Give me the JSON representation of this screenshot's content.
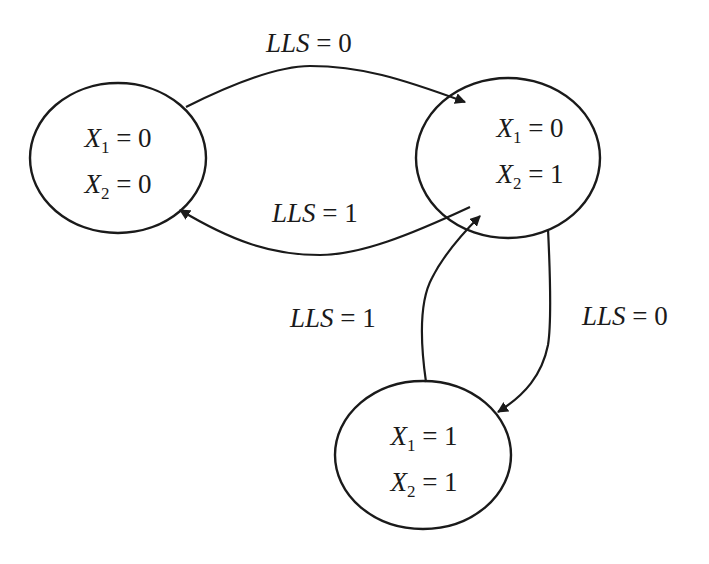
{
  "diagram": {
    "type": "state-transition",
    "colors": {
      "stroke": "#1a1a1a",
      "background": "#ffffff"
    },
    "states": [
      {
        "id": "s00",
        "lines": [
          {
            "var": "X",
            "sub": "1",
            "value": "0"
          },
          {
            "var": "X",
            "sub": "2",
            "value": "0"
          }
        ]
      },
      {
        "id": "s01",
        "lines": [
          {
            "var": "X",
            "sub": "1",
            "value": "0"
          },
          {
            "var": "X",
            "sub": "2",
            "value": "1"
          }
        ]
      },
      {
        "id": "s11",
        "lines": [
          {
            "var": "X",
            "sub": "1",
            "value": "1"
          },
          {
            "var": "X",
            "sub": "2",
            "value": "1"
          }
        ]
      }
    ],
    "transitions": [
      {
        "from": "s00",
        "to": "s01",
        "label_var": "LLS",
        "label_eq": " = ",
        "label_value": "0"
      },
      {
        "from": "s01",
        "to": "s00",
        "label_var": "LLS",
        "label_eq": " = ",
        "label_value": "1"
      },
      {
        "from": "s11",
        "to": "s01",
        "label_var": "LLS",
        "label_eq": " = ",
        "label_value": "1"
      },
      {
        "from": "s01",
        "to": "s11",
        "label_var": "LLS",
        "label_eq": " = ",
        "label_value": "0"
      }
    ]
  }
}
